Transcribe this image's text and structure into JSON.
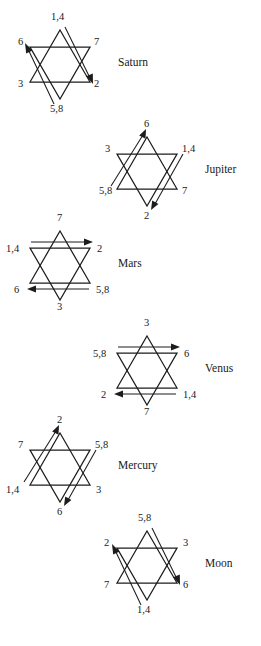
{
  "document": {
    "title": "Planetary hexagram orbit-order diagrams",
    "background_color": "#ffffff",
    "ink_color": "#1c1c1c",
    "figure_count": 6
  },
  "figures": [
    {
      "id": "saturn",
      "planet": "Saturn",
      "vertices": {
        "top": "1,4",
        "upper_left": "6",
        "upper_right": "7",
        "lower_left": "3",
        "lower_right": "2",
        "bottom": "5,8"
      },
      "arrows": [
        {
          "name": "arrow-to-upper-left",
          "from": "5,8",
          "to": "6",
          "direction": "up-left"
        },
        {
          "name": "arrow-to-lower-right",
          "from": "1,4",
          "to": "2",
          "direction": "down-right"
        }
      ]
    },
    {
      "id": "jupiter",
      "planet": "Jupiter",
      "vertices": {
        "top": "6",
        "upper_left": "3",
        "upper_right": "1,4",
        "lower_left": "5,8",
        "lower_right": "7",
        "bottom": "2"
      },
      "arrows": [
        {
          "name": "arrow-to-top",
          "from": "5,8",
          "to": "6",
          "direction": "up-right"
        },
        {
          "name": "arrow-to-bottom",
          "from": "1,4",
          "to": "2",
          "direction": "down-left"
        }
      ]
    },
    {
      "id": "mars",
      "planet": "Mars",
      "vertices": {
        "top": "7",
        "upper_left": "1,4",
        "upper_right": "2",
        "lower_left": "6",
        "lower_right": "5,8",
        "bottom": "3"
      },
      "arrows": [
        {
          "name": "arrow-to-upper-right",
          "from": "1,4",
          "to": "2",
          "direction": "right"
        },
        {
          "name": "arrow-to-lower-left",
          "from": "5,8",
          "to": "6",
          "direction": "left"
        }
      ]
    },
    {
      "id": "venus",
      "planet": "Venus",
      "vertices": {
        "top": "3",
        "upper_left": "5,8",
        "upper_right": "6",
        "lower_left": "2",
        "lower_right": "1,4",
        "bottom": "7"
      },
      "arrows": [
        {
          "name": "arrow-to-upper-right",
          "from": "5,8",
          "to": "6",
          "direction": "right"
        },
        {
          "name": "arrow-to-lower-left",
          "from": "1,4",
          "to": "2",
          "direction": "left"
        }
      ]
    },
    {
      "id": "mercury",
      "planet": "Mercury",
      "vertices": {
        "top": "2",
        "upper_left": "7",
        "upper_right": "5,8",
        "lower_left": "1,4",
        "lower_right": "3",
        "bottom": "6"
      },
      "arrows": [
        {
          "name": "arrow-to-top",
          "from": "1,4",
          "to": "2",
          "direction": "up-right"
        },
        {
          "name": "arrow-to-bottom",
          "from": "5,8",
          "to": "6",
          "direction": "down-left"
        }
      ]
    },
    {
      "id": "moon",
      "planet": "Moon",
      "vertices": {
        "top": "5,8",
        "upper_left": "2",
        "upper_right": "3",
        "lower_left": "7",
        "lower_right": "6",
        "bottom": "1,4"
      },
      "arrows": [
        {
          "name": "arrow-to-upper-left",
          "from": "1,4",
          "to": "2",
          "direction": "up-left"
        },
        {
          "name": "arrow-to-lower-right",
          "from": "5,8",
          "to": "6",
          "direction": "down-right"
        }
      ]
    }
  ]
}
